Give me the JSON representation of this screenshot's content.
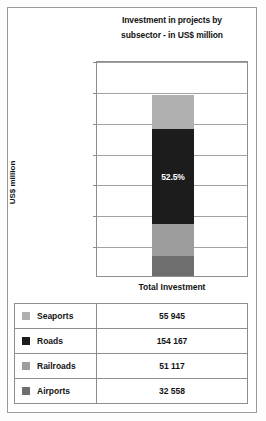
{
  "chart_data": {
    "type": "bar",
    "subtype": "stacked-single-column",
    "title": "Investment in projects by subsector  - in US$ million",
    "title_line1": "Investment in projects by",
    "title_line2": "subsector  - in US$ million",
    "xlabel": "Total Investment",
    "ylabel": "US$ million",
    "categories": [
      "Total Investment"
    ],
    "ylim": [
      0,
      350000
    ],
    "ytick_labels": [
      "350 000",
      "300 000",
      "250 000",
      "200 000",
      "150 000",
      "100 000",
      "50 000"
    ],
    "ytick_values": [
      350000,
      300000,
      250000,
      200000,
      150000,
      100000,
      50000
    ],
    "grid": true,
    "legend_position": "table-below",
    "annotations": [
      {
        "text": "52.5%",
        "series": "Roads",
        "color": "#ffffff"
      }
    ],
    "series": [
      {
        "name": "Seaports",
        "values": [
          55945
        ],
        "value_label": "55 945",
        "color": "#b0b0b0",
        "stack_order": 1
      },
      {
        "name": "Roads",
        "values": [
          154167
        ],
        "value_label": "154 167",
        "color": "#1c1c1c",
        "stack_order": 2
      },
      {
        "name": "Railroads",
        "values": [
          51117
        ],
        "value_label": "51 117",
        "color": "#9d9d9d",
        "stack_order": 3
      },
      {
        "name": "Airports",
        "values": [
          32558
        ],
        "value_label": "32 558",
        "color": "#6e6e6e",
        "stack_order": 4
      }
    ],
    "total": 293787
  },
  "legend_table": {
    "rows": [
      {
        "name": "Seaports",
        "value": "55 945",
        "swatch": "#b0b0b0"
      },
      {
        "name": "Roads",
        "value": "154 167",
        "swatch": "#1c1c1c"
      },
      {
        "name": "Railroads",
        "value": "51 117",
        "swatch": "#9d9d9d"
      },
      {
        "name": "Airports",
        "value": "32 558",
        "swatch": "#6e6e6e"
      }
    ]
  }
}
